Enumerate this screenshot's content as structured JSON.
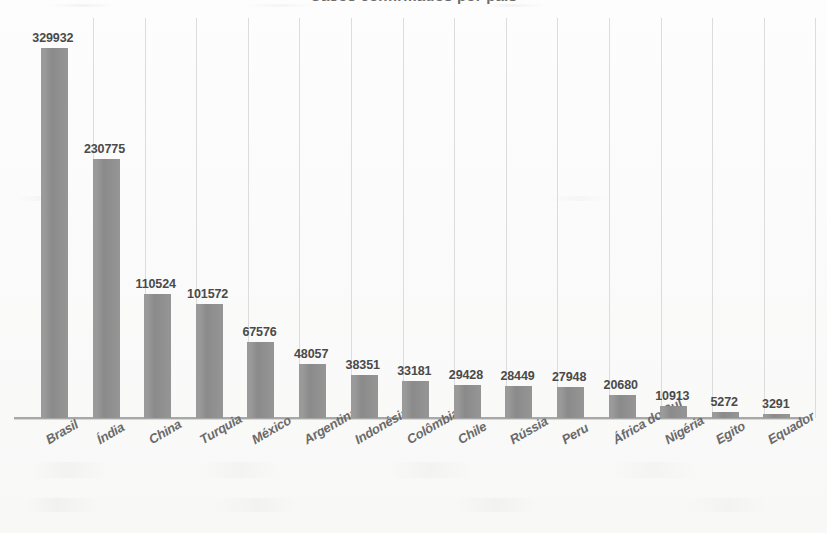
{
  "title": {
    "cropped_text": "Casos confirmados por país"
  },
  "chart_data": {
    "type": "bar",
    "title": "",
    "xlabel": "",
    "ylabel": "",
    "ylim": [
      0,
      329932
    ],
    "grid": "vertical",
    "legend": "none",
    "orientation": "vertical",
    "bar_color": "#8f8f8f",
    "categories": [
      "Brasil",
      "Índia",
      "China",
      "Turquia",
      "México",
      "Argentina",
      "Indonésia",
      "Colômbia",
      "Chile",
      "Rússia",
      "Peru",
      "África do Sul",
      "Nigéria",
      "Egito",
      "Equador"
    ],
    "values": [
      329932,
      230775,
      110524,
      101572,
      67576,
      48057,
      38351,
      33181,
      29428,
      28449,
      27948,
      20680,
      10913,
      5272,
      3291
    ],
    "value_labels": [
      "329932",
      "230775",
      "110524",
      "101572",
      "67576",
      "48057",
      "38351",
      "33181",
      "29428",
      "28449",
      "27948",
      "20680",
      "10913",
      "5272",
      "3291"
    ]
  }
}
